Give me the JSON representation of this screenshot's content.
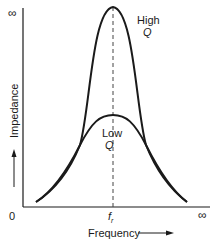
{
  "diagram": {
    "type": "resonance-curves",
    "y_axis": {
      "label": "Impedance",
      "top_label": "∞",
      "origin_label": "0"
    },
    "x_axis": {
      "label": "Frequency",
      "end_label": "∞",
      "resonance_label": "f",
      "resonance_subscript": "r"
    },
    "curves": [
      {
        "name": "High Q",
        "label_line1": "High",
        "label_line2": "Q"
      },
      {
        "name": "Low Q",
        "label_line1": "Low",
        "label_line2": "Q"
      }
    ],
    "colors": {
      "line": "#1a1a1a",
      "background": "#ffffff",
      "dashed": "#444444"
    }
  }
}
